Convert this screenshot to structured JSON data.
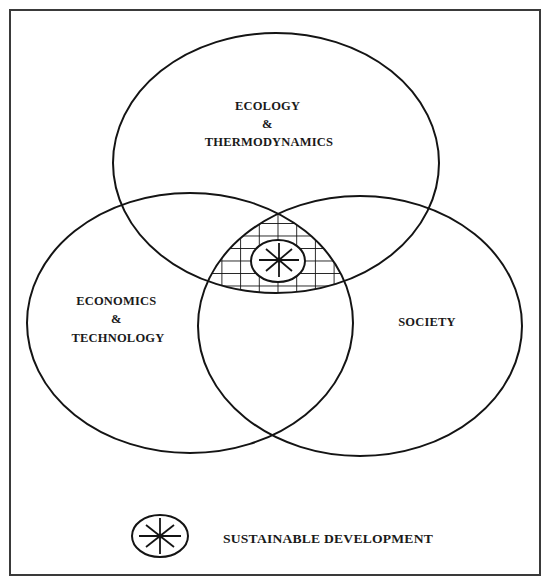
{
  "diagram": {
    "type": "venn",
    "circles": [
      {
        "id": "ecology",
        "label_lines": [
          "ECOLOGY",
          "&",
          "THERMODYNAMICS"
        ]
      },
      {
        "id": "economics",
        "label_lines": [
          "ECONOMICS",
          "&",
          "TECHNOLOGY"
        ]
      },
      {
        "id": "society",
        "label_lines": [
          "SOCIETY"
        ]
      }
    ],
    "intersection": {
      "sets": [
        "ecology",
        "economics",
        "society"
      ],
      "fill_pattern": "crosshatch-grid",
      "marker": "asterisk-in-ellipse-icon"
    },
    "legend": {
      "symbol": "asterisk-in-ellipse-icon",
      "label": "SUSTAINABLE DEVELOPMENT"
    },
    "colors": {
      "line": "#141414",
      "frame": "#3a3a3a",
      "background": "#ffffff",
      "text": "#1a1a1a"
    }
  }
}
